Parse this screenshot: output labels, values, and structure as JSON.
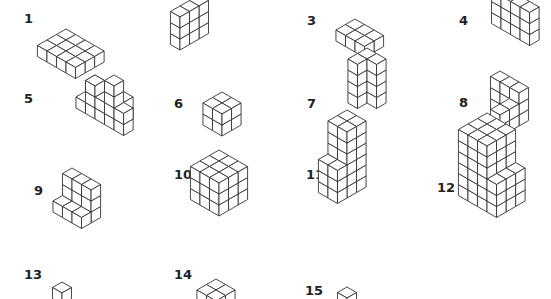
{
  "colors": {
    "background": "#ffffff",
    "line": "#333333",
    "face_top": "#ffffff",
    "face_left": "#ffffff",
    "face_right": "#ffffff",
    "label": "#222222"
  },
  "cube_size": 11,
  "figures": [
    {
      "label": "1",
      "label_pos": [
        24,
        12
      ],
      "origin": [
        66,
        40
      ],
      "boxes": [
        [
          0,
          0,
          0,
          4,
          3,
          1
        ]
      ]
    },
    {
      "label": "2",
      "label_pos": [
        176,
        13
      ],
      "origin": [
        199,
        28
      ],
      "boxes": [
        [
          0,
          0,
          0,
          1,
          3,
          3
        ]
      ]
    },
    {
      "label": "3",
      "label_pos": [
        307,
        14
      ],
      "origin": [
        355,
        30
      ],
      "boxes": [
        [
          0,
          0,
          0,
          3,
          2,
          1
        ]
      ]
    },
    {
      "label": "4",
      "label_pos": [
        459,
        14
      ],
      "origin": [
        501,
        18
      ],
      "boxes": [
        [
          0,
          0,
          0,
          4,
          1,
          3
        ]
      ]
    },
    {
      "label": "5",
      "label_pos": [
        24,
        92
      ],
      "origin": [
        95,
        97
      ],
      "boxes": [
        [
          0,
          0,
          0,
          4,
          1,
          2
        ],
        [
          0,
          1,
          0,
          1,
          1,
          1
        ],
        [
          1,
          1,
          0,
          1,
          1,
          3
        ],
        [
          2,
          1,
          0,
          1,
          1,
          2
        ],
        [
          3,
          1,
          0,
          1,
          1,
          4
        ],
        [
          4,
          1,
          0,
          1,
          1,
          2
        ]
      ]
    },
    {
      "label": "6",
      "label_pos": [
        174,
        97
      ],
      "origin": [
        222,
        114
      ],
      "boxes": [
        [
          0,
          0,
          0,
          2,
          2,
          2
        ]
      ]
    },
    {
      "label": "7",
      "label_pos": [
        307,
        97
      ],
      "origin": [
        367,
        92
      ],
      "boxes": [
        [
          0,
          0,
          0,
          1,
          2,
          4
        ],
        [
          0,
          0,
          0,
          2,
          1,
          4
        ]
      ]
    },
    {
      "label": "8",
      "label_pos": [
        459,
        96
      ],
      "origin": [
        500,
        104
      ],
      "boxes": [
        [
          0,
          0,
          0,
          3,
          1,
          3
        ],
        [
          2,
          0,
          0,
          1,
          3,
          2
        ],
        [
          2,
          2,
          0,
          1,
          1,
          1
        ],
        [
          0,
          0,
          0,
          1,
          1,
          1
        ]
      ]
    },
    {
      "label": "9",
      "label_pos": [
        34,
        184
      ],
      "origin": [
        72,
        201
      ],
      "boxes": [
        [
          0,
          0,
          0,
          3,
          1,
          3
        ],
        [
          0,
          0,
          0,
          3,
          2,
          1
        ]
      ]
    },
    {
      "label": "10",
      "label_pos": [
        174,
        168
      ],
      "origin": [
        219,
        183
      ],
      "boxes": [
        [
          0,
          0,
          0,
          3,
          3,
          3
        ]
      ]
    },
    {
      "label": "11",
      "label_pos": [
        306,
        168
      ],
      "origin": [
        347,
        176
      ],
      "boxes": [
        [
          0,
          0,
          0,
          2,
          2,
          6
        ],
        [
          0,
          2,
          0,
          2,
          1,
          3
        ]
      ]
    },
    {
      "label": "12",
      "label_pos": [
        437,
        181
      ],
      "origin": [
        487,
        179
      ],
      "boxes": [
        [
          0,
          0,
          0,
          3,
          3,
          6
        ],
        [
          3,
          0,
          0,
          1,
          3,
          3
        ]
      ]
    },
    {
      "label": "13",
      "label_pos": [
        24,
        268
      ],
      "origin": [
        62,
        293
      ],
      "boxes": [
        [
          0,
          0,
          0,
          1,
          1,
          1
        ]
      ]
    },
    {
      "label": "14",
      "label_pos": [
        174,
        268
      ],
      "origin": [
        216,
        290
      ],
      "boxes": [
        [
          0,
          0,
          0,
          2,
          2,
          1
        ]
      ]
    },
    {
      "label": "15",
      "label_pos": [
        305,
        284
      ],
      "origin": [
        347,
        298
      ],
      "boxes": [
        [
          0,
          0,
          0,
          1,
          1,
          1
        ]
      ]
    }
  ]
}
